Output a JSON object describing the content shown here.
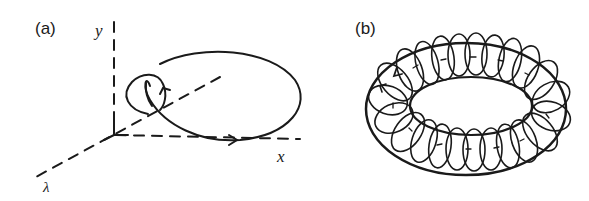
{
  "figure": {
    "panels": [
      {
        "id": "a",
        "label": "(a)",
        "axes": {
          "y": "y",
          "x": "x",
          "lambda": "λ"
        },
        "description": "Closed orbit loop in (x, y, λ) space with a small twist, arrows indicating direction"
      },
      {
        "id": "b",
        "label": "(b)",
        "description": "Torus formed by orbits winding around, with arrows indicating flow direction"
      }
    ],
    "colors": {
      "ink": "#1a1a1a",
      "background": "#ffffff"
    }
  }
}
